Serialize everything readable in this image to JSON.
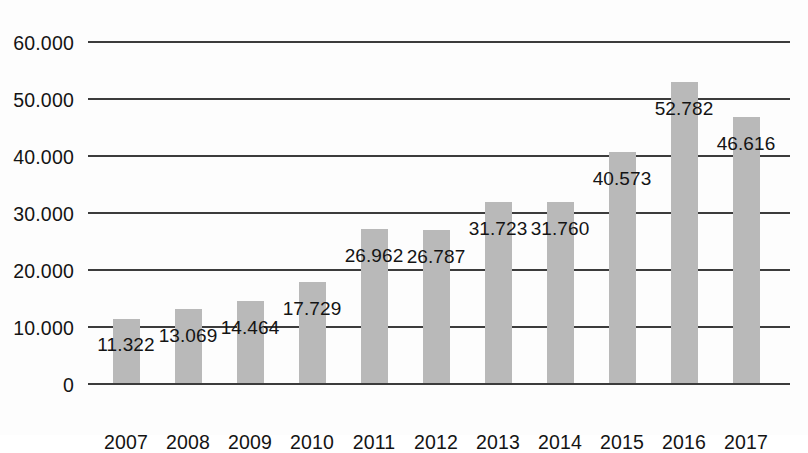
{
  "chart_data": {
    "type": "bar",
    "title": "",
    "subtitle": "",
    "xlabel": "",
    "ylabel": "",
    "categories": [
      "2007",
      "2008",
      "2009",
      "2010",
      "2011",
      "2012",
      "2013",
      "2014",
      "2015",
      "2016",
      "2017"
    ],
    "values": [
      11322,
      13069,
      14464,
      17729,
      26962,
      26787,
      31723,
      31760,
      40573,
      52782,
      46616
    ],
    "value_labels": [
      "11.322",
      "13.069",
      "14.464",
      "17.729",
      "26.962",
      "26.787",
      "31.723",
      "31.760",
      "40.573",
      "52.782",
      "46.616"
    ],
    "ylim": [
      0,
      60000
    ],
    "yticks": [
      0,
      10000,
      20000,
      30000,
      40000,
      50000,
      60000
    ],
    "ytick_labels": [
      "0",
      "10.000",
      "20.000",
      "30.000",
      "40.000",
      "50.000",
      "60.000"
    ],
    "grid": true,
    "legend": "none",
    "bar_color": "#b9b9b9",
    "axis_color": "#3c3c3c",
    "text_color": "#141414",
    "background_color": "#fdfdfd",
    "number_format": "european-thousands-dot"
  }
}
